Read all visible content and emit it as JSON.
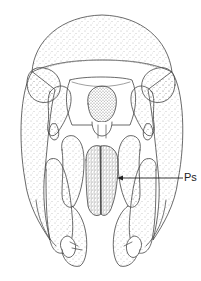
{
  "figure": {
    "background": "#ffffff",
    "ink_color": "#444444",
    "stipple_color": "#666666"
  },
  "annotations": [
    {
      "id": "ps",
      "text": "Ps",
      "x": 186,
      "y": 178,
      "arrow_from": [
        183,
        178
      ],
      "arrow_to": [
        118,
        178
      ]
    }
  ]
}
